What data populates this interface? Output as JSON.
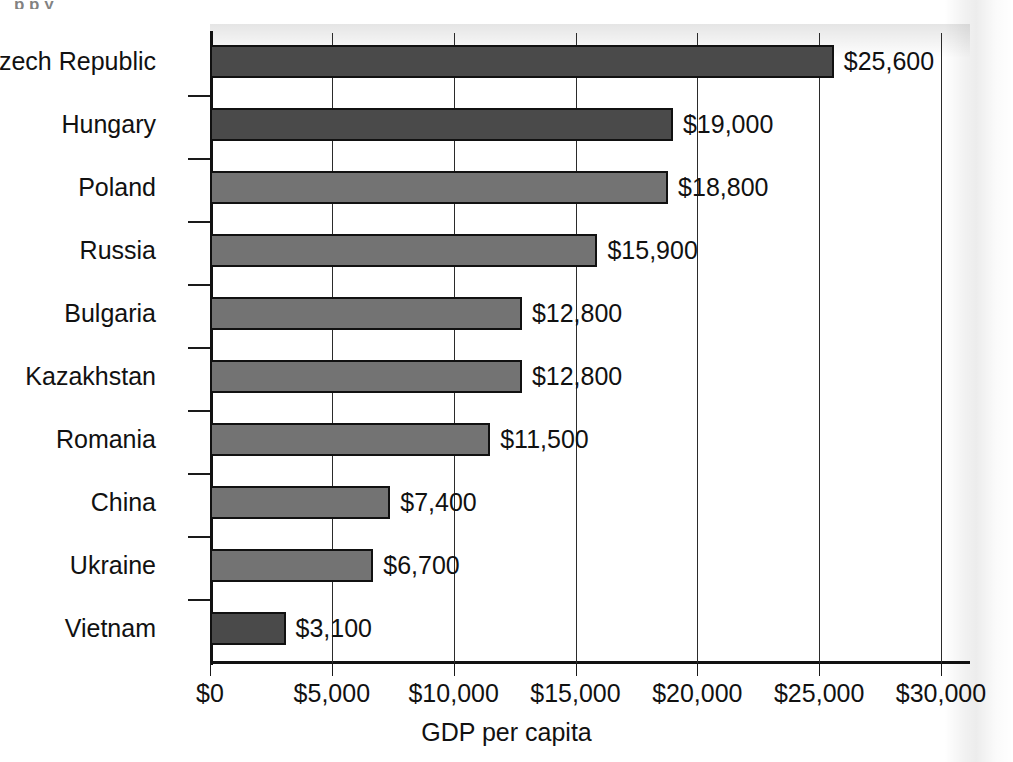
{
  "chart_data": {
    "type": "bar",
    "orientation": "horizontal",
    "title": "",
    "xlabel": "GDP per capita",
    "ylabel": "",
    "categories": [
      "Czech Republic",
      "Hungary",
      "Poland",
      "Russia",
      "Bulgaria",
      "Kazakhstan",
      "Romania",
      "China",
      "Ukraine",
      "Vietnam"
    ],
    "values": [
      25600,
      19000,
      18800,
      15900,
      12800,
      12800,
      11500,
      7400,
      6700,
      3100
    ],
    "value_labels": [
      "$25,600",
      "$19,000",
      "$18,800",
      "$15,900",
      "$12,800",
      "$12,800",
      "$11,500",
      "$7,400",
      "$6,700",
      "$3,100"
    ],
    "bar_colors": [
      "#4a4a4a",
      "#4a4a4a",
      "#737373",
      "#737373",
      "#737373",
      "#737373",
      "#737373",
      "#737373",
      "#737373",
      "#4a4a4a"
    ],
    "xlim": [
      0,
      30000
    ],
    "xticks": [
      0,
      5000,
      10000,
      15000,
      20000,
      25000,
      30000
    ],
    "xtick_labels": [
      "$0",
      "$5,000",
      "$10,000",
      "$15,000",
      "$20,000",
      "$25,000",
      "$30,000"
    ],
    "grid": true,
    "grid_axis": "x",
    "legend": null
  },
  "axes": {
    "x_axis_label": "GDP per capita"
  },
  "artifact": {
    "cropped_title_fragment": "p p y"
  }
}
